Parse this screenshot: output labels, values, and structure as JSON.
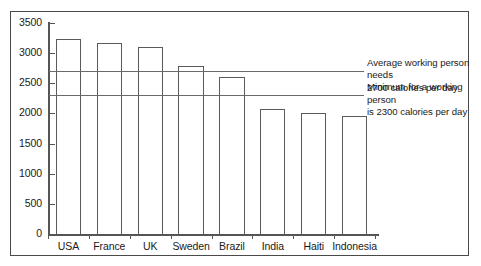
{
  "chart_data": {
    "type": "bar",
    "title": "",
    "subtitle": "",
    "xlabel": "",
    "ylabel": "",
    "categories": [
      "USA",
      "France",
      "UK",
      "Sweden",
      "Brazil",
      "India",
      "Haiti",
      "Indonesia"
    ],
    "values": [
      3230,
      3160,
      3110,
      2780,
      2610,
      2080,
      2010,
      1950
    ],
    "series": [
      {
        "name": "Calories per person per day",
        "values": [
          3230,
          3160,
          3110,
          2780,
          2610,
          2080,
          2010,
          1950
        ]
      }
    ],
    "ylim": [
      0,
      3500
    ],
    "xlim_categories": 8,
    "y_ticks": [
      0,
      500,
      1000,
      1500,
      2000,
      2500,
      3000,
      3500
    ],
    "y_tick_labels": [
      "0",
      "500",
      "1000",
      "1500",
      "2000",
      "2500",
      "3000",
      "3500"
    ],
    "grid": false,
    "legend": "none",
    "bar_fill": "#ffffff",
    "bar_edge": "#5a5a5a",
    "axis_color": "#555555",
    "frame_color": "#4a4a4a",
    "reference_lines": [
      {
        "name": "average-need-line",
        "value": 2700,
        "color": "#6a6a6a",
        "label": "Average working person needs\n2700 calories per day"
      },
      {
        "name": "minimum-need-line",
        "value": 2300,
        "color": "#6a6a6a",
        "label": "Minimum for a working person\nis 2300  calories per day"
      }
    ],
    "annotations": [
      "Average working person needs\n2700 calories per day",
      "Minimum for a working person\nis 2300  calories per day"
    ]
  }
}
